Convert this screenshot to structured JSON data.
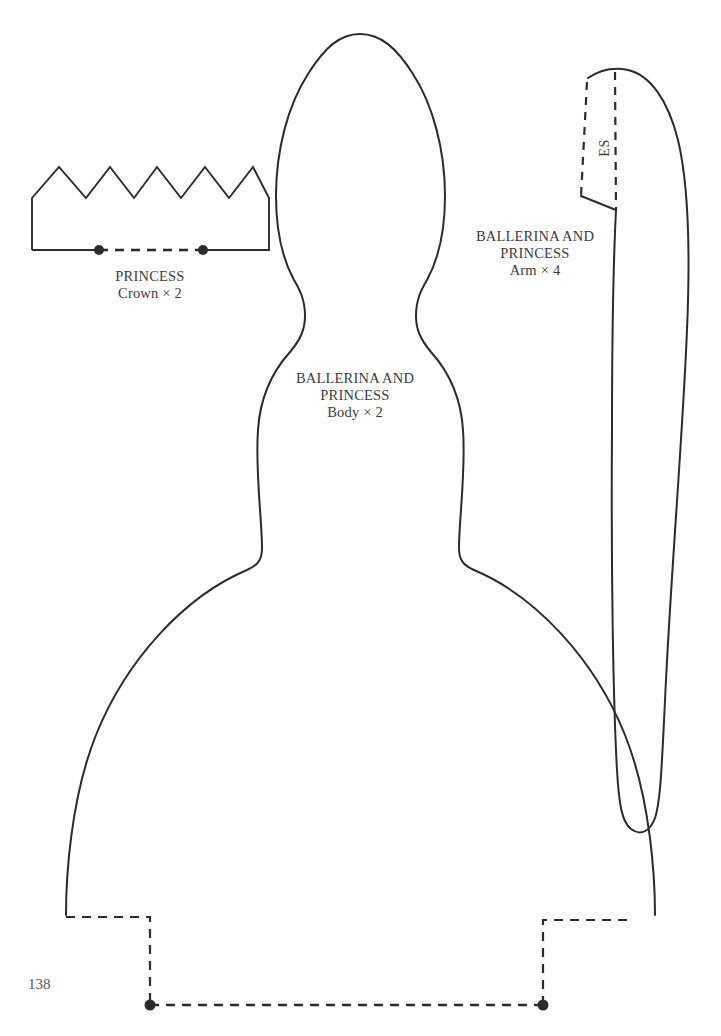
{
  "page": {
    "number": "138",
    "background_color": "#ffffff",
    "ink_color": "#2b2b2b",
    "text_color": "#3b3b3b"
  },
  "pieces": {
    "crown": {
      "title_line1": "PRINCESS",
      "title_line2": "Crown × 2",
      "peaks": 5,
      "fold_line_style": "dashed-with-end-dots"
    },
    "body": {
      "title_line1": "BALLERINA AND",
      "title_line2": "PRINCESS",
      "title_line3": "Body × 2",
      "hem_line_style": "dashed-stepped-with-end-dots"
    },
    "arm": {
      "title_line1": "BALLERINA AND",
      "title_line2": "PRINCESS",
      "title_line3": "Arm × 4",
      "seam_label": "ES",
      "seam_label_rotation_deg": -90
    }
  }
}
